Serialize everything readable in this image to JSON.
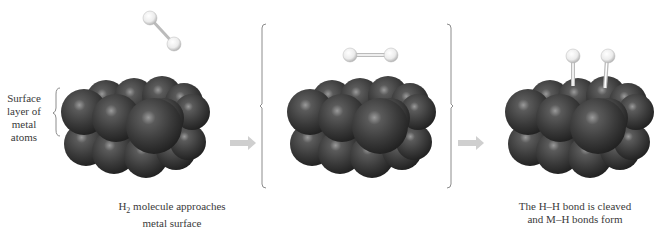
{
  "side_label": {
    "lines": [
      "Surface",
      "layer of",
      "metal",
      "atoms"
    ]
  },
  "panels": [
    {
      "id": "approach",
      "caption_line1_pre": "H",
      "caption_line1_sub": "2",
      "caption_line1_post": " molecule approaches",
      "caption_line2": "metal surface",
      "molecule": "H2 tilted above surface"
    },
    {
      "id": "adsorbed",
      "caption": "",
      "molecule": "H2 horizontal above surface (bracketed intermediate)"
    },
    {
      "id": "cleaved",
      "caption_line1": "The H–H bond is cleaved",
      "caption_line2": "and M–H bonds form",
      "molecule": "Two H atoms bonded to metal surface"
    }
  ],
  "colors": {
    "metal_atom": "#3c3c3c",
    "metal_highlight": "#8a8a8a",
    "hydrogen_atom": "#f2f2f2",
    "arrow": "#cfcfcf",
    "bracket": "#8c8c8c",
    "text": "#3a3a3a"
  }
}
